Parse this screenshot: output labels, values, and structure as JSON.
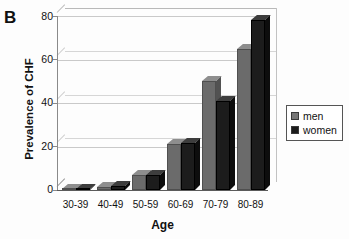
{
  "figure": {
    "panel_label": "B"
  },
  "legend": {
    "position": "right",
    "entries": [
      {
        "label": "men",
        "color": "#6b6b6b"
      },
      {
        "label": "women",
        "color": "#1c1c1c"
      }
    ]
  },
  "axes": {
    "ylabel": "Prevalence of CHF",
    "xlabel": "Age",
    "yticks": [
      "80",
      "60",
      "40",
      "20",
      "0"
    ],
    "xticks": [
      "30-39",
      "40-49",
      "50-59",
      "60-69",
      "70-79",
      "80-89"
    ]
  },
  "chart_data": {
    "type": "bar",
    "title": "B",
    "xlabel": "Age",
    "ylabel": "Prevalence of CHF",
    "categories": [
      "30-39",
      "40-49",
      "50-59",
      "60-69",
      "70-79",
      "80-89"
    ],
    "series": [
      {
        "name": "men",
        "color": "#6b6b6b",
        "values": [
          0.5,
          1.5,
          7,
          21,
          50,
          65
        ]
      },
      {
        "name": "women",
        "color": "#1c1c1c",
        "values": [
          0.5,
          2,
          7,
          21.5,
          41,
          78
        ]
      }
    ],
    "ylim": [
      0,
      80
    ],
    "ytick_values": [
      0,
      20,
      40,
      60,
      80
    ],
    "grid": "horizontal",
    "legend_position": "right",
    "style": "3d-grayscale"
  }
}
